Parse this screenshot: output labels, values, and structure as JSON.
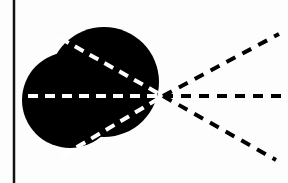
{
  "diagram": {
    "colors": {
      "background": "#fdfdfd",
      "shape": "#000000",
      "inner_rays": "#ffffff",
      "outer_rays": "#000000",
      "border_line": "#111111"
    },
    "vertex": {
      "x": 163,
      "y": 96
    },
    "border_line": {
      "x": 14,
      "y1": 0,
      "y2": 183
    },
    "blob": {
      "main_circle": {
        "cx": 70,
        "cy": 100,
        "r": 48
      },
      "lobe_circle": {
        "cx": 104,
        "cy": 82,
        "r": 55
      }
    },
    "inner_rays": [
      {
        "name": "upper",
        "x1": 60,
        "y1": 38
      },
      {
        "name": "middle",
        "x1": 28,
        "y1": 96
      },
      {
        "name": "lower",
        "x1": 62,
        "y1": 156
      }
    ],
    "outer_rays": [
      {
        "name": "upper",
        "x2": 279,
        "y2": 34
      },
      {
        "name": "middle",
        "x2": 288,
        "y2": 96
      },
      {
        "name": "lower",
        "x2": 276,
        "y2": 160
      }
    ]
  }
}
